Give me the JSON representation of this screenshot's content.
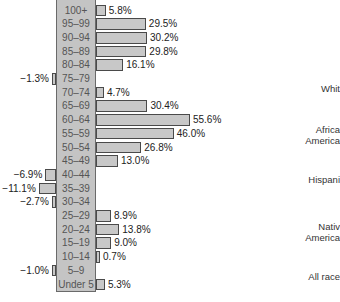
{
  "chart_data": {
    "type": "bar",
    "orientation": "horizontal",
    "title": "",
    "xlabel": "",
    "ylabel": "Age group",
    "categories": [
      "100+",
      "95–99",
      "90–94",
      "85–89",
      "80–84",
      "75–79",
      "70–74",
      "65–69",
      "60–64",
      "55–59",
      "50–54",
      "45–49",
      "40–44",
      "35–39",
      "30–34",
      "25–29",
      "20–24",
      "15–19",
      "10–14",
      "5–9",
      "Under 5"
    ],
    "values": [
      5.8,
      29.5,
      30.2,
      29.8,
      16.1,
      -1.3,
      4.7,
      30.4,
      55.6,
      46.0,
      26.8,
      13.0,
      -6.9,
      -11.1,
      -2.7,
      8.9,
      13.8,
      9.0,
      0.7,
      -1.0,
      5.3
    ],
    "value_labels": [
      "5.8%",
      "29.5%",
      "30.2%",
      "29.8%",
      "16.1%",
      "−1.3%",
      "4.7%",
      "30.4%",
      "55.6%",
      "46.0%",
      "26.8%",
      "13.0%",
      "−6.9%",
      "−11.1%",
      "−2.7%",
      "8.9%",
      "13.8%",
      "9.0%",
      "0.7%",
      "−1.0%",
      "5.3%"
    ],
    "unit": "%",
    "grid": false,
    "legend_position": "right",
    "legend": [
      "Whit",
      "Africa\nAmerica",
      "Hispani",
      "Nativ\nAmerica",
      "All race"
    ]
  },
  "colors": {
    "bar_fill": "#c8c8c8",
    "bar_border": "#4a4a4a",
    "age_column_fill": "#c4c4c4"
  },
  "legend_positions": [
    83,
    124,
    174,
    221,
    271
  ]
}
